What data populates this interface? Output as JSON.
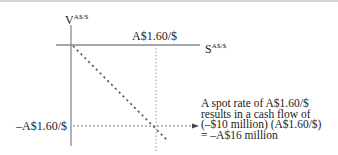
{
  "diagram": {
    "type": "payoff-diagram",
    "y_axis": {
      "symbol": "V",
      "superscript": "A$/$"
    },
    "x_axis": {
      "symbol": "S",
      "superscript": "A$/$"
    },
    "x_marker_label": "A$1.60/$",
    "y_marker_label": "–A$1.60/$",
    "annotation": {
      "lines": [
        "A spot rate of A$1.60/$",
        "results in a cash flow of",
        "(–$10 million) (A$1.60/$)",
        "= –A$16 million"
      ]
    },
    "line": {
      "style": "dashed",
      "slope": "negative",
      "from": "origin"
    },
    "colors": {
      "axis": "#8a8a8a",
      "dashed": "#555555",
      "text": "#222222",
      "border": "#d4d4d4"
    }
  }
}
